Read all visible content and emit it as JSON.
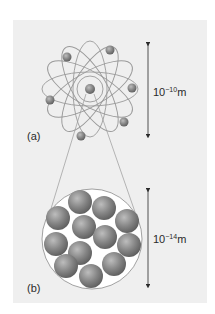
{
  "figure": {
    "background_color": "#f0f0f0",
    "panel_a": {
      "label": "(a)",
      "description": "Atom with electrons orbiting a central nucleus",
      "scale": {
        "base": "10",
        "exponent": "−10",
        "unit": "m"
      }
    },
    "panel_b": {
      "label": "(b)",
      "description": "Magnified nucleus composed of packed nucleons",
      "nucleon_count": 12,
      "scale": {
        "base": "10",
        "exponent": "−14",
        "unit": "m"
      }
    },
    "colors": {
      "panel": "#efefef",
      "orbit": "#9a9a9a",
      "sphere": "#7d7d7d",
      "sphere_highlight": "#b5b5b5",
      "arrow": "#2a2a2a",
      "text": "#2a2a2a"
    }
  }
}
